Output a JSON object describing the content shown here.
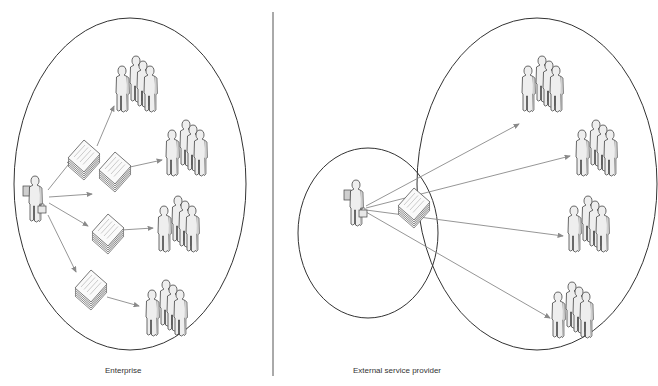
{
  "diagram": {
    "type": "comparison",
    "panels": [
      {
        "id": "enterprise",
        "caption": "Enterprise",
        "boundary": {
          "shape": "ellipse",
          "cx": 130,
          "cy": 184,
          "rx": 116,
          "ry": 166
        },
        "source": {
          "icon": "businessperson-icon",
          "x": 35,
          "y": 200
        },
        "documents": [
          {
            "icon": "document-stack-icon",
            "x": 82,
            "y": 144
          },
          {
            "icon": "document-stack-icon",
            "x": 115,
            "y": 174
          },
          {
            "icon": "document-stack-icon",
            "x": 100,
            "y": 215
          },
          {
            "icon": "document-stack-icon",
            "x": 90,
            "y": 290
          }
        ],
        "groups": [
          {
            "icon": "user-group-icon",
            "x": 118,
            "y": 64
          },
          {
            "icon": "user-group-icon",
            "x": 166,
            "y": 128
          },
          {
            "icon": "user-group-icon",
            "x": 158,
            "y": 196
          },
          {
            "icon": "user-group-icon",
            "x": 145,
            "y": 288
          }
        ]
      },
      {
        "id": "external",
        "caption": "External service provider",
        "boundary_inner": {
          "shape": "ellipse",
          "cx": 368,
          "cy": 233,
          "rx": 70,
          "ry": 85
        },
        "boundary_outer": {
          "shape": "ellipse",
          "cx": 537,
          "cy": 184,
          "rx": 120,
          "ry": 166
        },
        "source": {
          "icon": "businessperson-icon",
          "x": 357,
          "y": 205
        },
        "documents": [
          {
            "icon": "document-stack-icon",
            "x": 413,
            "y": 213
          }
        ],
        "groups": [
          {
            "icon": "user-group-icon",
            "x": 526,
            "y": 62
          },
          {
            "icon": "user-group-icon",
            "x": 580,
            "y": 124
          },
          {
            "icon": "user-group-icon",
            "x": 570,
            "y": 196
          },
          {
            "icon": "user-group-icon",
            "x": 556,
            "y": 288
          }
        ]
      }
    ],
    "divider": {
      "x": 273,
      "y1": 12,
      "y2": 376
    },
    "colors": {
      "outline": "#333333",
      "arrow": "#8a8a8a",
      "figure_fill": "#eeeeee",
      "figure_stroke": "#444444",
      "background": "#ffffff"
    }
  }
}
